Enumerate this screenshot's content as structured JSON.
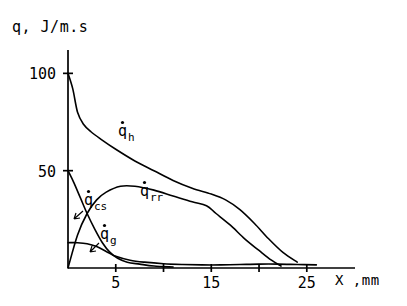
{
  "chart_data": {
    "type": "line",
    "title": "",
    "ylabel": "q, J/m.s",
    "xlabel": "X ,mm",
    "xlim": [
      0,
      29
    ],
    "ylim": [
      0,
      112
    ],
    "grid": false,
    "legend_position": "inline-annotations",
    "x_ticks": [
      {
        "value": 5,
        "label": "5"
      },
      {
        "value": 10,
        "label": ""
      },
      {
        "value": 15,
        "label": "15"
      },
      {
        "value": 20,
        "label": ""
      },
      {
        "value": 25,
        "label": "25"
      }
    ],
    "y_ticks": [
      {
        "value": 50,
        "label": "50"
      },
      {
        "value": 100,
        "label": "100"
      }
    ],
    "series": [
      {
        "name": "q_h",
        "label_base": "q",
        "label_sub": "h",
        "label_dot": true,
        "x": [
          0,
          0.5,
          1.0,
          1.6,
          2.4,
          3.5,
          5.0,
          7.0,
          9.0,
          11.0,
          13.0,
          15.0,
          16.5,
          18.0,
          19.5,
          21.0,
          22.5,
          24.0
        ],
        "values": [
          100,
          92,
          80,
          74,
          70,
          66,
          61,
          55,
          50,
          45,
          41,
          38,
          35,
          30,
          23,
          15,
          8,
          3
        ]
      },
      {
        "name": "q_rr",
        "label_base": "q",
        "label_sub": "rr",
        "label_dot": true,
        "x": [
          0,
          1.0,
          2.0,
          3.0,
          4.0,
          5.5,
          7.0,
          9.0,
          11.0,
          13.0,
          14.5,
          15.5,
          17.0,
          18.5,
          20.0,
          21.3,
          22.3
        ],
        "values": [
          0,
          17,
          28,
          35,
          39,
          42,
          42,
          40,
          37,
          34,
          32,
          28,
          22,
          15,
          9,
          4,
          1
        ]
      },
      {
        "name": "q_cs",
        "label_base": "q",
        "label_sub": "cs",
        "label_dot": true,
        "x": [
          0,
          0.6,
          1.3,
          2.0,
          2.8,
          3.6,
          4.4,
          5.2,
          6.2,
          7.5,
          9.0,
          11.0
        ],
        "values": [
          50,
          44,
          36,
          28,
          20,
          13,
          8,
          5,
          3,
          2,
          1,
          0.5
        ]
      },
      {
        "name": "q_g",
        "label_base": "q",
        "label_sub": "g",
        "label_dot": true,
        "x": [
          0,
          1.0,
          2.0,
          3.0,
          4.0,
          5.0,
          6.5,
          8.0,
          10.0,
          12.0,
          14.0,
          16.0,
          18.0,
          20.0,
          22.0,
          24.0,
          26.0
        ],
        "values": [
          13,
          13,
          12.5,
          11,
          8.5,
          6,
          4,
          3,
          2.2,
          1.8,
          1.6,
          1.6,
          1.8,
          2.0,
          2.0,
          1.8,
          1.6
        ]
      }
    ],
    "annotations": [
      {
        "name": "q_h",
        "text_x": 118,
        "text_y": 136
      },
      {
        "name": "q_rr",
        "text_x": 140,
        "text_y": 196
      },
      {
        "name": "q_cs",
        "text_x": 84,
        "text_y": 205
      },
      {
        "name": "q_g",
        "text_x": 100,
        "text_y": 239
      }
    ]
  }
}
